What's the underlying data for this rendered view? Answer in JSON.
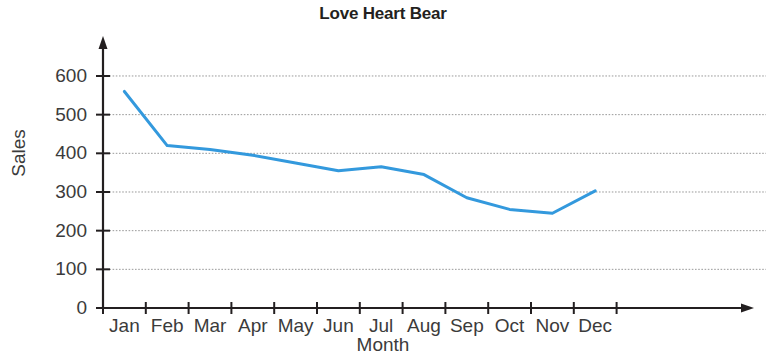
{
  "chart_data": {
    "type": "line",
    "title": "Love Heart Bear",
    "xlabel": "Month",
    "ylabel": "Sales",
    "categories": [
      "Jan",
      "Feb",
      "Mar",
      "Apr",
      "May",
      "Jun",
      "Jul",
      "Aug",
      "Sep",
      "Oct",
      "Nov",
      "Dec"
    ],
    "values": [
      560,
      420,
      410,
      395,
      375,
      355,
      365,
      345,
      285,
      255,
      245,
      303
    ],
    "series": [
      {
        "name": "Sales",
        "values": [
          560,
          420,
          410,
          395,
          375,
          355,
          365,
          345,
          285,
          255,
          245,
          303
        ],
        "color": "#3399dd"
      }
    ],
    "ylim": [
      0,
      650
    ],
    "yticks": [
      0,
      100,
      200,
      300,
      400,
      500,
      600
    ],
    "ytick_labels": [
      "0",
      "100",
      "200",
      "300",
      "400",
      "500",
      "600"
    ],
    "grid": true,
    "grid_axis": "y",
    "grid_color": "#999999",
    "legend": "none",
    "axis_color": "#231f20",
    "line_width": 3
  }
}
